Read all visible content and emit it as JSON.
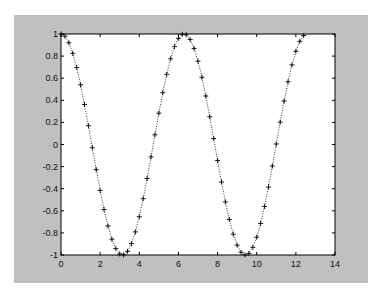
{
  "caption_top": "",
  "colors": {
    "figure_bg": "#c0c0c0",
    "axes_bg": "#ffffff",
    "line": "#000000"
  },
  "chart_data": {
    "type": "line",
    "title": "",
    "xlabel": "",
    "ylabel": "",
    "xlim": [
      0,
      14
    ],
    "ylim": [
      -1,
      1
    ],
    "grid": false,
    "legend": null,
    "xticks": [
      "0",
      "2",
      "4",
      "6",
      "8",
      "10",
      "12",
      "14"
    ],
    "yticks": [
      "1",
      "0.8",
      "0.6",
      "0.4",
      "0.2",
      "0",
      "-0.2",
      "-0.4",
      "-0.6",
      "-0.8",
      "-1"
    ],
    "series": [
      {
        "name": "cos(x)",
        "marker": "+",
        "linestyle": "dotted",
        "function": "y = cos(x), x from 0 to 4*pi step 0.2",
        "x_range": [
          0,
          12.57
        ]
      }
    ]
  }
}
